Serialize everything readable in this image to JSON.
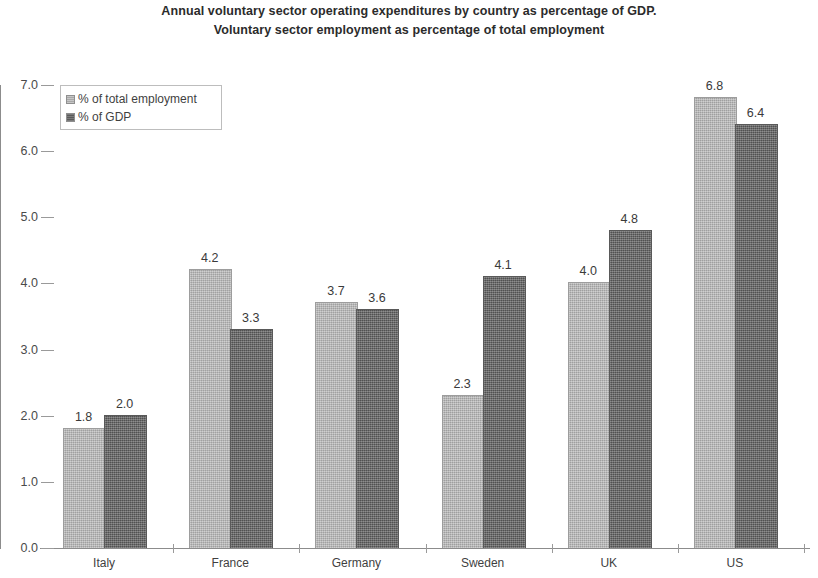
{
  "chart_data": {
    "type": "bar",
    "title": "Annual voluntary sector operating expenditures by country as percentage of GDP. Voluntary sector employment as percentage of total employment",
    "title_lines": [
      "Annual voluntary sector operating expenditures by country as percentage of GDP.",
      "Voluntary sector employment as percentage of total employment"
    ],
    "categories": [
      "Italy",
      "France",
      "Germany",
      "Sweden",
      "UK",
      "US"
    ],
    "series": [
      {
        "name": "% of total employment",
        "color": "#b3b3b3",
        "values": [
          1.8,
          4.2,
          3.7,
          2.3,
          4.0,
          6.8
        ],
        "labels": [
          "1.8",
          "4.2",
          "3.7",
          "2.3",
          "4.0",
          "6.8"
        ]
      },
      {
        "name": "% of GDP",
        "color": "#646464",
        "values": [
          2.0,
          3.3,
          3.6,
          4.1,
          4.8,
          6.4
        ],
        "labels": [
          "2.0",
          "3.3",
          "3.6",
          "4.1",
          "4.8",
          "6.4"
        ]
      }
    ],
    "xlabel": "",
    "ylabel": "",
    "ylim": [
      0.0,
      7.0
    ],
    "ytick_values": [
      0.0,
      1.0,
      2.0,
      3.0,
      4.0,
      5.0,
      6.0,
      7.0
    ],
    "ytick_labels": [
      "0.0",
      "1.0",
      "2.0",
      "3.0",
      "4.0",
      "5.0",
      "6.0",
      "7.0"
    ],
    "grid": false,
    "legend_position": "top-left",
    "data_labels_shown": true
  },
  "legend": {
    "entries": [
      {
        "label": "% of total employment",
        "swatch": "light-gray-swatch"
      },
      {
        "label": "% of GDP",
        "swatch": "dark-gray-swatch"
      }
    ]
  }
}
